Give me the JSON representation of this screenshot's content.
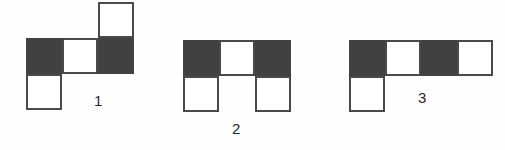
{
  "page": {
    "background_color": "#fefefe"
  },
  "style": {
    "dark_fill": "#414141",
    "light_fill": "#ffffff",
    "border_color": "#4a4a4a",
    "label_color": "#2a2a2a",
    "cell_size_px": 36
  },
  "figures": [
    {
      "id": "figure-1",
      "label": "1",
      "label_position": {
        "x": 94,
        "y": 93
      },
      "origin": {
        "x": 26,
        "y": 2
      },
      "grid_columns": 3,
      "grid_rows": 3,
      "cells": [
        {
          "name": "figure-1-cell-top-right",
          "col": 2,
          "row": 0,
          "fill": "light"
        },
        {
          "name": "figure-1-cell-mid-left",
          "col": 0,
          "row": 1,
          "fill": "dark"
        },
        {
          "name": "figure-1-cell-mid-center",
          "col": 1,
          "row": 1,
          "fill": "light"
        },
        {
          "name": "figure-1-cell-mid-right",
          "col": 2,
          "row": 1,
          "fill": "dark"
        },
        {
          "name": "figure-1-cell-bottom-left",
          "col": 0,
          "row": 2,
          "fill": "light"
        }
      ]
    },
    {
      "id": "figure-2",
      "label": "2",
      "label_position": {
        "x": 232,
        "y": 121
      },
      "origin": {
        "x": 183,
        "y": 40
      },
      "grid_columns": 3,
      "grid_rows": 2,
      "cells": [
        {
          "name": "figure-2-cell-top-left",
          "col": 0,
          "row": 0,
          "fill": "dark"
        },
        {
          "name": "figure-2-cell-top-center",
          "col": 1,
          "row": 0,
          "fill": "light"
        },
        {
          "name": "figure-2-cell-top-right",
          "col": 2,
          "row": 0,
          "fill": "dark"
        },
        {
          "name": "figure-2-cell-bottom-left",
          "col": 0,
          "row": 1,
          "fill": "light"
        },
        {
          "name": "figure-2-cell-bottom-right",
          "col": 2,
          "row": 1,
          "fill": "light"
        }
      ]
    },
    {
      "id": "figure-3",
      "label": "3",
      "label_position": {
        "x": 418,
        "y": 90
      },
      "origin": {
        "x": 349,
        "y": 40
      },
      "grid_columns": 4,
      "grid_rows": 2,
      "cells": [
        {
          "name": "figure-3-cell-top-1",
          "col": 0,
          "row": 0,
          "fill": "dark"
        },
        {
          "name": "figure-3-cell-top-2",
          "col": 1,
          "row": 0,
          "fill": "light"
        },
        {
          "name": "figure-3-cell-top-3",
          "col": 2,
          "row": 0,
          "fill": "dark"
        },
        {
          "name": "figure-3-cell-top-4",
          "col": 3,
          "row": 0,
          "fill": "light"
        },
        {
          "name": "figure-3-cell-bottom-1",
          "col": 0,
          "row": 1,
          "fill": "light"
        }
      ]
    }
  ]
}
